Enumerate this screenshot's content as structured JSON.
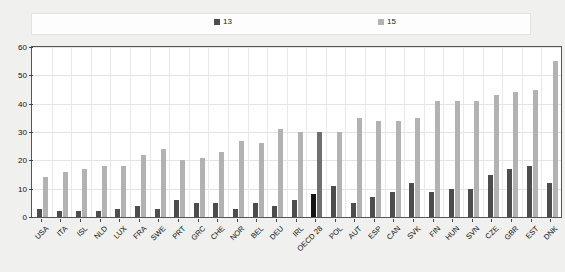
{
  "chart_data": {
    "type": "bar",
    "title": "",
    "subtitle": "",
    "xlabel": "",
    "ylabel": "",
    "ylim": [
      0,
      60
    ],
    "yticks": [
      0,
      10,
      20,
      30,
      40,
      50,
      60
    ],
    "grid": true,
    "legend_position": "top",
    "categories": [
      "USA",
      "ITA",
      "ISL",
      "NLD",
      "LUX",
      "FRA",
      "SWE",
      "PRT",
      "GRC",
      "CHE",
      "NOR",
      "BEL",
      "DEU",
      "IRL",
      "OECD 28",
      "POL",
      "AUT",
      "ESP",
      "CAN",
      "SVK",
      "FIN",
      "HUN",
      "SVN",
      "CZE",
      "GBR",
      "EST",
      "DNK"
    ],
    "highlight_category": "OECD 28",
    "series": [
      {
        "name": "13",
        "color": "#4d4d4d",
        "highlight_color": "#121212",
        "values": [
          3,
          2,
          2,
          2,
          3,
          4,
          3,
          6,
          5,
          5,
          3,
          5,
          4,
          6,
          8,
          11,
          5,
          7,
          9,
          12,
          9,
          10,
          10,
          15,
          17,
          18,
          12
        ]
      },
      {
        "name": "15",
        "color": "#b2b2b2",
        "highlight_color": "#6f6f6f",
        "values": [
          14,
          16,
          17,
          18,
          18,
          22,
          24,
          20,
          21,
          23,
          27,
          26,
          31,
          30,
          30,
          30,
          35,
          34,
          34,
          35,
          41,
          41,
          41,
          43,
          44,
          45,
          55
        ]
      }
    ]
  },
  "legend": {
    "entries": [
      {
        "label": "13",
        "color": "#4d4d4d"
      },
      {
        "label": "15",
        "color": "#b2b2b2"
      }
    ]
  },
  "axes": {
    "y": {
      "ticks": [
        "0",
        "10",
        "20",
        "30",
        "40",
        "50",
        "60"
      ]
    }
  }
}
